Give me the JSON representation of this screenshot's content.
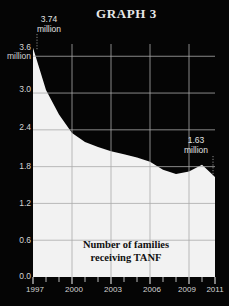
{
  "title": "GRAPH 3",
  "caption_line1": "Number of families",
  "caption_line2": "receiving TANF",
  "callouts": {
    "start_value": "3.74",
    "start_unit": "million",
    "end_value": "1.63",
    "end_unit": "million"
  },
  "axis": {
    "y_top_label": "3.6",
    "y_top_unit": "million",
    "y_ticks": [
      "3.6",
      "3.0",
      "2.4",
      "1.8",
      "1.2",
      "0.6",
      "0.0"
    ],
    "x_ticks": [
      "1997",
      "2000",
      "2003",
      "2006",
      "2009",
      "2011"
    ]
  },
  "colors": {
    "background": "#050505",
    "area_fill": "#f2f2f2",
    "gridline": "#a9a9a9",
    "axis_text": "#d4d4d4",
    "title_text": "#e8e8e8",
    "caption_text": "#101010"
  },
  "chart_data": {
    "type": "area",
    "title": "GRAPH 3",
    "subtitle": "Number of families receiving TANF",
    "xlabel": "",
    "ylabel": "millions of families",
    "xlim": [
      1997,
      2011
    ],
    "ylim": [
      0.0,
      3.8
    ],
    "ytick_values": [
      0.0,
      0.6,
      1.2,
      1.8,
      2.4,
      3.0,
      3.6
    ],
    "ytick_labels": [
      "0.0",
      "0.6",
      "1.2",
      "1.8",
      "2.4",
      "3.0",
      "3.6"
    ],
    "xtick_values": [
      1997,
      2000,
      2003,
      2006,
      2009,
      2011
    ],
    "xtick_labels": [
      "1997",
      "2000",
      "2003",
      "2006",
      "2009",
      "2011"
    ],
    "grid": true,
    "legend": "none",
    "x": [
      1997,
      1998,
      1999,
      2000,
      2001,
      2002,
      2003,
      2004,
      2005,
      2006,
      2007,
      2008,
      2009,
      2010,
      2011
    ],
    "values": [
      3.74,
      3.05,
      2.65,
      2.35,
      2.2,
      2.12,
      2.05,
      2.0,
      1.95,
      1.88,
      1.75,
      1.68,
      1.72,
      1.83,
      1.63
    ],
    "annotations": [
      {
        "x": 1997,
        "y": 3.74,
        "label": "3.74 million"
      },
      {
        "x": 2011,
        "y": 1.63,
        "label": "1.63 million"
      }
    ]
  }
}
